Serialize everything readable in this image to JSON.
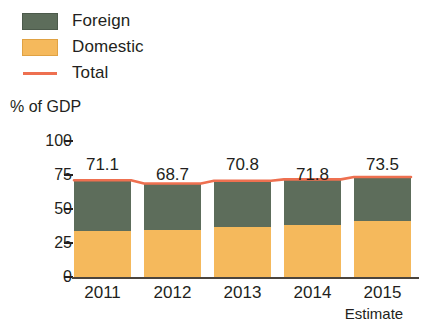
{
  "legend": {
    "items": [
      {
        "label": "Foreign",
        "color": "#5d6d5b",
        "marker": "square"
      },
      {
        "label": "Domestic",
        "color": "#f5b95c",
        "marker": "square"
      },
      {
        "label": "Total",
        "color": "#ee7050",
        "marker": "line"
      }
    ]
  },
  "axis": {
    "y_title": "% of GDP",
    "y_ticks": [
      "100",
      "75",
      "50",
      "25",
      "0"
    ]
  },
  "notes": {
    "estimate": "Estimate"
  },
  "chart_data": {
    "type": "bar",
    "stacked": true,
    "title": "",
    "subtitle": "",
    "xlabel": "",
    "ylabel": "% of GDP",
    "ylim": [
      0,
      100
    ],
    "ytick_values": [
      0,
      25,
      50,
      75,
      100
    ],
    "grid": false,
    "legend_position": "top-left",
    "categories": [
      "2011",
      "2012",
      "2013",
      "2014",
      "2015"
    ],
    "series": [
      {
        "name": "Domestic",
        "color": "#f5b95c",
        "type": "bar",
        "values": [
          34.0,
          34.5,
          36.5,
          38.5,
          41.0
        ]
      },
      {
        "name": "Foreign",
        "color": "#5d6d5b",
        "type": "bar",
        "values": [
          37.1,
          34.2,
          34.3,
          33.3,
          32.5
        ]
      },
      {
        "name": "Total",
        "color": "#ee7050",
        "type": "line",
        "values": [
          71.1,
          68.7,
          70.8,
          71.8,
          73.5
        ]
      }
    ],
    "data_labels": [
      "71.1",
      "68.7",
      "70.8",
      "71.8",
      "73.5"
    ],
    "annotations": [
      "Estimate"
    ]
  }
}
